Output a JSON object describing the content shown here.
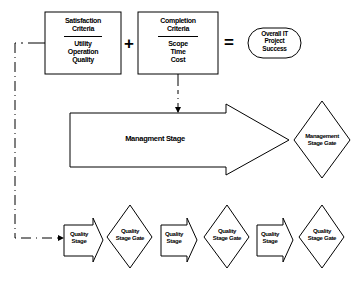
{
  "satisfaction": {
    "title_line1": "Satisfaction",
    "title_line2": "Criteria",
    "items": [
      "Utility",
      "Operation",
      "Quality"
    ]
  },
  "completion": {
    "title_line1": "Completion",
    "title_line2": "Criteria",
    "items": [
      "Scope",
      "Time",
      "Cost"
    ]
  },
  "operators": {
    "plus": "+",
    "equals": "="
  },
  "outcome": {
    "line1": "Overall IT",
    "line2": "Project",
    "line3": "Success"
  },
  "management": {
    "stage_label": "Managment Stage",
    "gate_line1": "Management",
    "gate_line2": "Stage Gate"
  },
  "quality_flow": [
    {
      "stage_line1": "Quality",
      "stage_line2": "Stage",
      "gate_line1": "Quality",
      "gate_line2": "Stage Gate"
    },
    {
      "stage_line1": "Quality",
      "stage_line2": "Stage",
      "gate_line1": "Quality",
      "gate_line2": "Stage Gate"
    },
    {
      "stage_line1": "Quality",
      "stage_line2": "Stage",
      "gate_line1": "Quality",
      "gate_line2": "Stage Gate"
    }
  ]
}
